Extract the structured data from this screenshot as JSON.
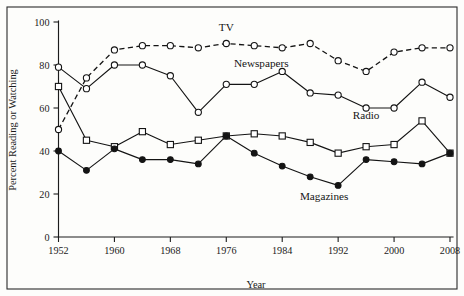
{
  "chart_data": {
    "type": "line",
    "title": "",
    "xlabel": "Year",
    "ylabel": "Percent Reading or Watching",
    "grid": false,
    "legend_position": "inline-annotations",
    "xlim": [
      1952,
      2008
    ],
    "ylim": [
      0,
      100
    ],
    "x_ticks": [
      1952,
      1960,
      1968,
      1976,
      1984,
      1992,
      2000,
      2008
    ],
    "y_ticks": [
      0,
      20,
      40,
      60,
      80,
      100
    ],
    "x": [
      1952,
      1956,
      1960,
      1964,
      1968,
      1972,
      1976,
      1980,
      1984,
      1988,
      1992,
      1996,
      2000,
      2004,
      2008
    ],
    "series": [
      {
        "name": "TV",
        "marker": "open-circle",
        "line_style": "dashed",
        "label_x": 1976,
        "label_y": 96,
        "values": [
          50,
          74,
          87,
          89,
          89,
          88,
          90,
          89,
          88,
          90,
          82,
          77,
          86,
          88,
          88
        ]
      },
      {
        "name": "Newspapers",
        "marker": "open-circle",
        "line_style": "solid",
        "label_x": 1981,
        "label_y": 79,
        "values": [
          79,
          69,
          80,
          80,
          75,
          58,
          71,
          71,
          77,
          67,
          66,
          60,
          60,
          72,
          65
        ]
      },
      {
        "name": "Radio",
        "marker": "open-square",
        "line_style": "solid",
        "label_x": 1996,
        "label_y": 55,
        "values": [
          70,
          45,
          42,
          49,
          43,
          45,
          47,
          48,
          47,
          44,
          39,
          42,
          43,
          54,
          39
        ]
      },
      {
        "name": "Magazines",
        "marker": "filled-circle",
        "line_style": "solid",
        "label_x": 1990,
        "label_y": 17,
        "values": [
          40,
          31,
          41,
          36,
          36,
          34,
          47,
          39,
          33,
          28,
          24,
          36,
          35,
          34,
          39
        ]
      }
    ]
  },
  "axis_labels": {
    "x_title": "Year",
    "y_title": "Percent Reading or Watching"
  },
  "colors": {
    "ink": "#141414",
    "background": "#fdfdfb",
    "marker_fill": "#ffffff"
  }
}
